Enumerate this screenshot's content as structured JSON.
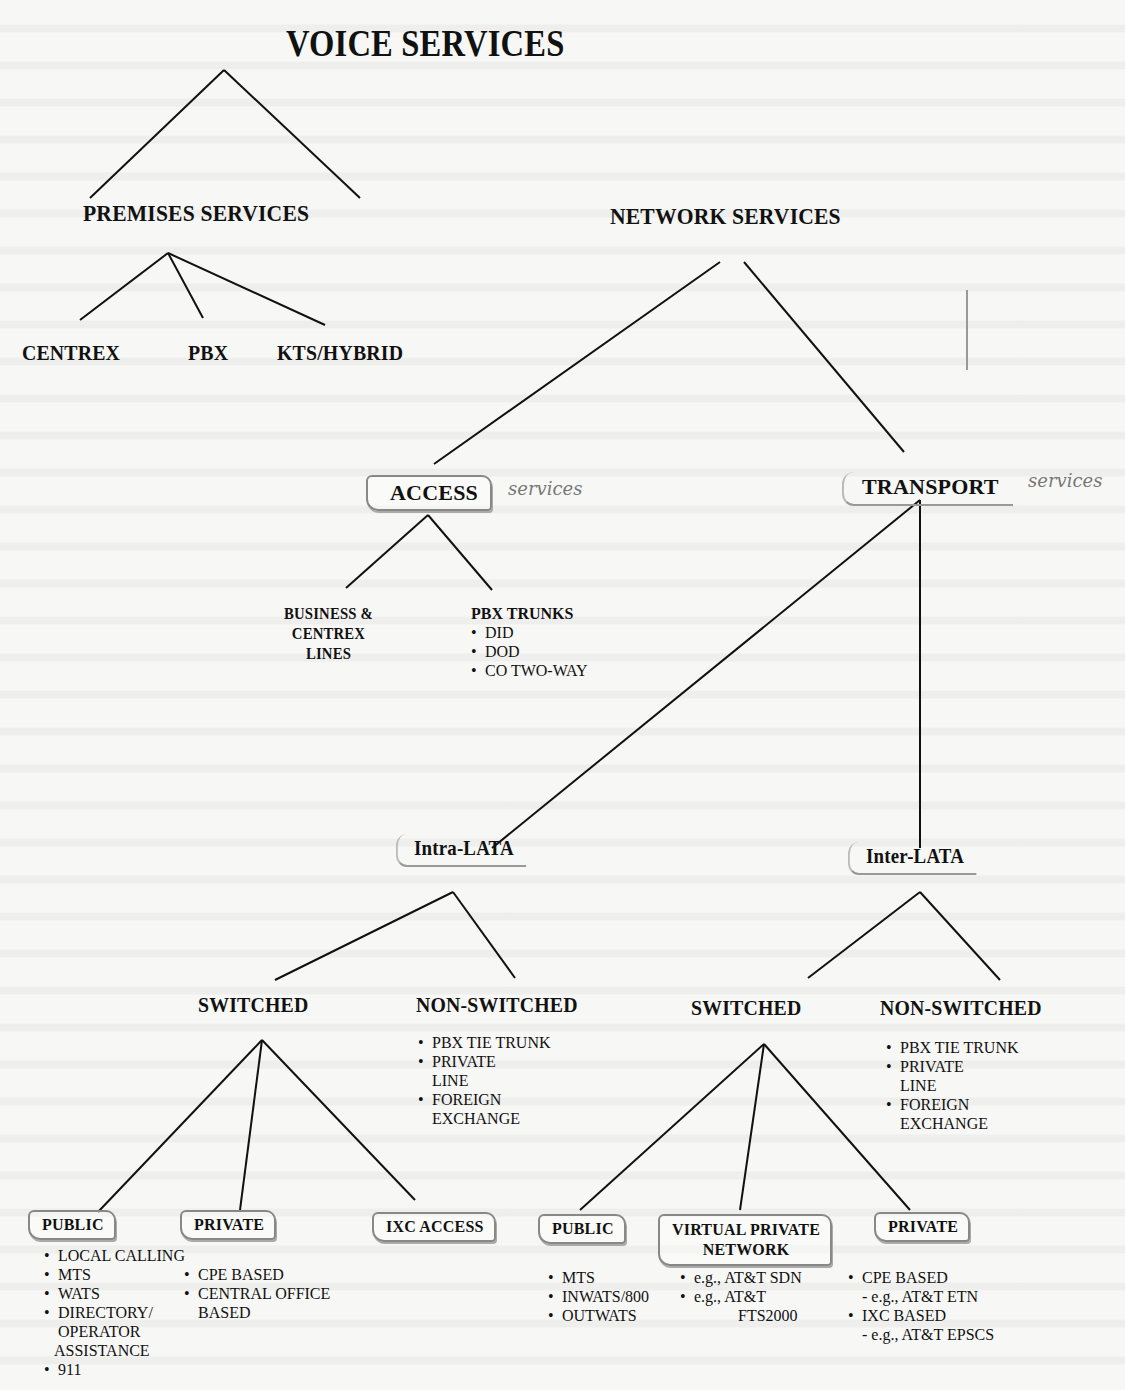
{
  "diagram": {
    "title": "VOICE SERVICES",
    "premises": {
      "label": "PREMISES SERVICES",
      "children": [
        "CENTREX",
        "PBX",
        "KTS/HYBRID"
      ]
    },
    "network": {
      "label": "NETWORK SERVICES",
      "access": {
        "label": "ACCESS",
        "annotation": "services",
        "business_lines": {
          "line1": "BUSINESS &",
          "line2": "CENTREX",
          "line3": "LINES"
        },
        "pbx_trunks": {
          "label": "PBX TRUNKS",
          "items": [
            "DID",
            "DOD",
            "CO TWO-WAY"
          ]
        }
      },
      "transport": {
        "label": "TRANSPORT",
        "annotation": "services",
        "intra_lata": {
          "label": "Intra-LATA",
          "switched": {
            "label": "SWITCHED",
            "public": {
              "label": "PUBLIC",
              "items": [
                "LOCAL CALLING",
                "MTS",
                "WATS",
                "DIRECTORY/",
                "OPERATOR",
                "ASSISTANCE",
                "911"
              ]
            },
            "private": {
              "label": "PRIVATE",
              "items": [
                "CPE BASED",
                "CENTRAL OFFICE",
                "BASED"
              ]
            },
            "ixc_access": {
              "label": "IXC ACCESS"
            }
          },
          "non_switched": {
            "label": "NON-SWITCHED",
            "items": [
              "PBX TIE TRUNK",
              "PRIVATE",
              "LINE",
              "FOREIGN",
              "EXCHANGE"
            ]
          }
        },
        "inter_lata": {
          "label": "Inter-LATA",
          "switched": {
            "label": "SWITCHED",
            "public": {
              "label": "PUBLIC",
              "items": [
                "MTS",
                "INWATS/800",
                "OUTWATS"
              ]
            },
            "vpn": {
              "label_line1": "VIRTUAL PRIVATE",
              "label_line2": "NETWORK",
              "items": [
                "e.g., AT&T SDN",
                "e.g., AT&T",
                "FTS2000"
              ]
            },
            "private": {
              "label": "PRIVATE",
              "items": [
                "CPE BASED",
                "- e.g., AT&T ETN",
                "IXC BASED",
                "- e.g., AT&T  EPSCS"
              ]
            }
          },
          "non_switched": {
            "label": "NON-SWITCHED",
            "items": [
              "PBX TIE TRUNK",
              "PRIVATE",
              "LINE",
              "FOREIGN",
              "EXCHANGE"
            ]
          }
        }
      }
    }
  }
}
